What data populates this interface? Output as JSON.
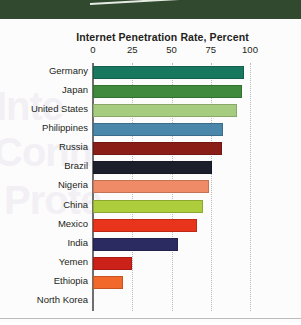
{
  "page": {
    "background_color": "#fcfcfc",
    "top_band_color": "#31492f",
    "ghost_text": [
      "Inte",
      "Conn",
      "Prote"
    ]
  },
  "chart_data": {
    "type": "bar",
    "orientation": "horizontal",
    "title": "Internet Penetration Rate, Percent",
    "xlabel": "",
    "ylabel": "",
    "xlim": [
      0,
      100
    ],
    "xticks": [
      0,
      25,
      50,
      75,
      100
    ],
    "xtick_labels": [
      "0",
      "25",
      "50",
      "75",
      "100"
    ],
    "grid": true,
    "grid_style": "dotted-vertical",
    "legend": false,
    "categories": [
      "Germany",
      "Japan",
      "United States",
      "Philippines",
      "Russia",
      "Brazil",
      "Nigeria",
      "China",
      "Mexico",
      "India",
      "Yemen",
      "Ethiopia",
      "North Korea"
    ],
    "values": [
      96,
      95,
      92,
      83,
      82,
      76,
      74,
      70,
      66,
      54,
      25,
      19,
      0
    ],
    "colors": [
      "#18775f",
      "#3f8a3c",
      "#a6cc7f",
      "#4b86ab",
      "#8b1d17",
      "#1b1f2b",
      "#ef8b66",
      "#adcd3c",
      "#e8341b",
      "#2b2a61",
      "#cc2119",
      "#f2672a",
      "#ffffff"
    ],
    "bars": [
      {
        "category": "Germany",
        "value": 96,
        "color": "#18775f"
      },
      {
        "category": "Japan",
        "value": 95,
        "color": "#3f8a3c"
      },
      {
        "category": "United States",
        "value": 92,
        "color": "#a6cc7f"
      },
      {
        "category": "Philippines",
        "value": 83,
        "color": "#4b86ab"
      },
      {
        "category": "Russia",
        "value": 82,
        "color": "#8b1d17"
      },
      {
        "category": "Brazil",
        "value": 76,
        "color": "#1b1f2b"
      },
      {
        "category": "Nigeria",
        "value": 74,
        "color": "#ef8b66"
      },
      {
        "category": "China",
        "value": 70,
        "color": "#adcd3c"
      },
      {
        "category": "Mexico",
        "value": 66,
        "color": "#e8341b"
      },
      {
        "category": "India",
        "value": 54,
        "color": "#2b2a61"
      },
      {
        "category": "Yemen",
        "value": 25,
        "color": "#cc2119"
      },
      {
        "category": "Ethiopia",
        "value": 19,
        "color": "#f2672a"
      },
      {
        "category": "North Korea",
        "value": 0,
        "color": "#ffffff"
      }
    ]
  }
}
